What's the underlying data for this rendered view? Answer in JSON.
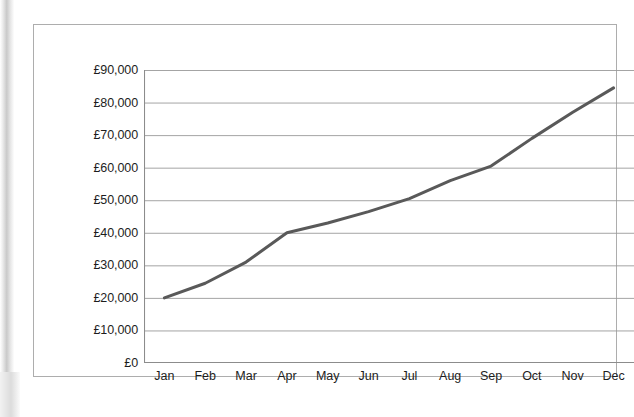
{
  "chart_data": {
    "type": "line",
    "title": "",
    "subtitle": "",
    "xlabel": "",
    "ylabel": "",
    "categories": [
      "Jan",
      "Feb",
      "Mar",
      "Apr",
      "May",
      "Jun",
      "Jul",
      "Aug",
      "Sep",
      "Oct",
      "Nov",
      "Dec"
    ],
    "series": [
      {
        "name": "",
        "values": [
          20000,
          24500,
          31000,
          40000,
          43000,
          46500,
          50500,
          56000,
          60500,
          69000,
          77000,
          84500
        ],
        "color": "#595959"
      }
    ],
    "ylim": [
      0,
      90000
    ],
    "ytick_values": [
      0,
      10000,
      20000,
      30000,
      40000,
      50000,
      60000,
      70000,
      80000,
      90000
    ],
    "ytick_labels": [
      "£0",
      "£10,000",
      "£20,000",
      "£30,000",
      "£40,000",
      "£50,000",
      "£60,000",
      "£70,000",
      "£80,000",
      "£90,000"
    ],
    "currency_symbol": "£",
    "grid": {
      "horizontal": true,
      "vertical": false,
      "color": "#9a9a9a"
    },
    "legend": {
      "visible": false,
      "position": "none"
    },
    "axis_color": "#8c8c8c",
    "frame_color": "#adadad",
    "plot_background": "#ffffff",
    "markers": false
  }
}
